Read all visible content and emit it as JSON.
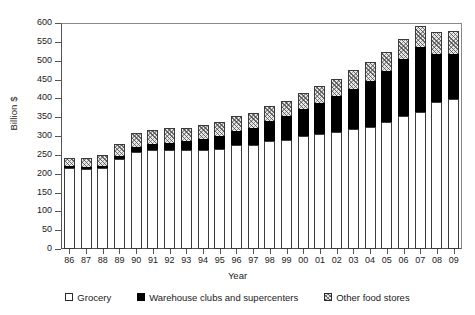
{
  "chart_data": {
    "type": "bar",
    "stacked": true,
    "title": "",
    "xlabel": "Year",
    "ylabel": "Billion $",
    "ylim": [
      0,
      600
    ],
    "ytick_step": 50,
    "yticks": [
      0,
      50,
      100,
      150,
      200,
      250,
      300,
      350,
      400,
      450,
      500,
      550,
      600
    ],
    "grid": false,
    "legend_position": "bottom",
    "categories": [
      "86",
      "87",
      "88",
      "89",
      "90",
      "91",
      "92",
      "93",
      "94",
      "95",
      "96",
      "97",
      "98",
      "99",
      "00",
      "01",
      "02",
      "03",
      "04",
      "05",
      "06",
      "07",
      "08",
      "09"
    ],
    "series": [
      {
        "name": "Grocery",
        "color": "#ffffff",
        "pattern": "solid-white",
        "values": [
          216,
          212,
          215,
          238,
          258,
          262,
          262,
          262,
          263,
          266,
          275,
          276,
          286,
          290,
          300,
          305,
          310,
          318,
          325,
          336,
          352,
          365,
          390,
          398
        ]
      },
      {
        "name": "Warehouse clubs and supercenters",
        "color": "#000000",
        "pattern": "solid-black",
        "values": [
          4,
          5,
          6,
          8,
          13,
          16,
          20,
          24,
          29,
          34,
          39,
          46,
          54,
          62,
          72,
          83,
          95,
          108,
          122,
          136,
          152,
          172,
          128,
          120
        ]
      },
      {
        "name": "Other food stores",
        "color": "#e9e9e9",
        "pattern": "diagonal-hatch",
        "values": [
          22,
          26,
          29,
          32,
          36,
          38,
          38,
          36,
          36,
          37,
          38,
          39,
          40,
          41,
          43,
          45,
          47,
          48,
          50,
          52,
          54,
          56,
          58,
          60
        ]
      }
    ],
    "totals": [
      242,
      243,
      250,
      278,
      307,
      316,
      320,
      322,
      328,
      337,
      352,
      361,
      380,
      393,
      415,
      433,
      452,
      474,
      497,
      524,
      558,
      593,
      576,
      578
    ]
  },
  "legend": {
    "items": [
      {
        "label": "Grocery",
        "marker": "hollow-square-icon"
      },
      {
        "label": "Warehouse clubs and supercenters",
        "marker": "filled-square-icon"
      },
      {
        "label": "Other food stores",
        "marker": "hatched-square-icon"
      }
    ]
  }
}
